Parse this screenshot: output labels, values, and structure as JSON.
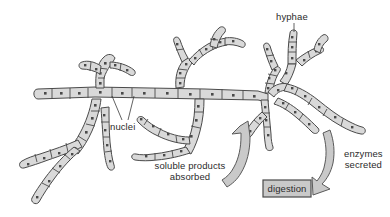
{
  "diagram": {
    "background_color": "#ffffff",
    "hypha_fill_color": "#d9d9d9",
    "outline_color": "#4a4a4a",
    "arrow_fill_color": "#c9c9c9",
    "text_color": "#2b2b2b"
  },
  "labels": {
    "hyphae": "hyphae",
    "nuclei": "nuclei",
    "soluble_products": "soluble products\nabsorbed",
    "enzymes_secreted": "enzymes\nsecreted",
    "digestion": "digestion"
  },
  "cycle": {
    "left_arrow_meaning": "soluble products absorbed",
    "right_arrow_meaning": "enzymes secreted"
  }
}
